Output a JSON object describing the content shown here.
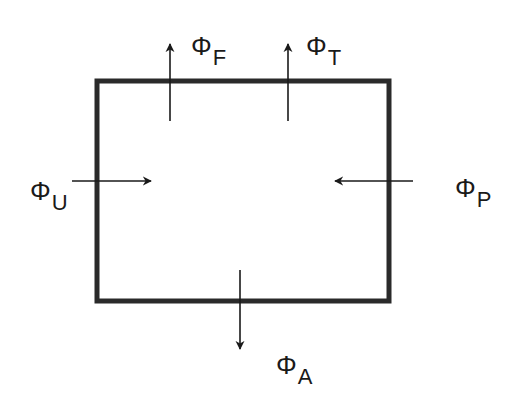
{
  "diagram": {
    "title": "",
    "box": {
      "x": 97,
      "y": 81,
      "width": 292,
      "height": 220,
      "stroke": "#2a2a2a",
      "stroke_width": 5
    },
    "arrows": [
      {
        "id": "F",
        "direction": "up",
        "symbol": "Φ",
        "subscript": "F"
      },
      {
        "id": "T",
        "direction": "up",
        "symbol": "Φ",
        "subscript": "T"
      },
      {
        "id": "U",
        "direction": "right",
        "symbol": "Φ",
        "subscript": "U"
      },
      {
        "id": "P",
        "direction": "left",
        "symbol": "Φ",
        "subscript": "P"
      },
      {
        "id": "A",
        "direction": "down",
        "symbol": "Φ",
        "subscript": "A"
      }
    ],
    "colors": {
      "line": "#1a1a1a",
      "background": "#ffffff"
    }
  }
}
